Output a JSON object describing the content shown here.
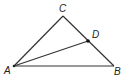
{
  "diagram": {
    "type": "triangle",
    "points": {
      "A": {
        "label": "A",
        "x": 14,
        "y": 66
      },
      "B": {
        "label": "B",
        "x": 114,
        "y": 66
      },
      "C": {
        "label": "C",
        "x": 63,
        "y": 16
      },
      "D": {
        "label": "D",
        "x": 88,
        "y": 41
      }
    },
    "segments": [
      "AB",
      "BC",
      "CA",
      "AD"
    ]
  }
}
